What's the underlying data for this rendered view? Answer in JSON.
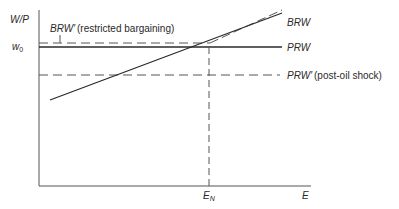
{
  "diagram": {
    "type": "economics-labor-market",
    "y_axis_label": "W/P",
    "x_axis_label": "E",
    "y_tick_label_base": "w",
    "y_tick_label_sub": "0",
    "x_tick_label_base": "E",
    "x_tick_label_sub": "N",
    "curves": [
      {
        "id": "BRW",
        "label": "BRW",
        "style": "solid",
        "shape": "upward-sloping"
      },
      {
        "id": "BRW-prime",
        "label": "BRW′",
        "annotation": "(restricted bargaining)",
        "style": "dashed",
        "shape": "flat-then-upward"
      },
      {
        "id": "PRW",
        "label": "PRW",
        "style": "solid",
        "shape": "horizontal"
      },
      {
        "id": "PRW-prime",
        "label": "PRW′",
        "annotation": "(post-oil shock)",
        "style": "dashed",
        "shape": "horizontal"
      }
    ],
    "equilibrium_guide": {
      "style": "dashed",
      "from": "E_N",
      "to": "PRW/BRW intersection"
    }
  },
  "labels": {
    "wp": "W/P",
    "w0_main": "w",
    "w0_sub": "0",
    "brw_prime": "BRW′",
    "brw_prime_note": "(restricted bargaining)",
    "brw": "BRW",
    "prw": "PRW",
    "prw_prime": "PRW′",
    "prw_prime_note": "(post-oil shock)",
    "en_main": "E",
    "en_sub": "N",
    "e": "E"
  },
  "colors": {
    "ink": "#2a2a2a",
    "dash": "#555555"
  }
}
